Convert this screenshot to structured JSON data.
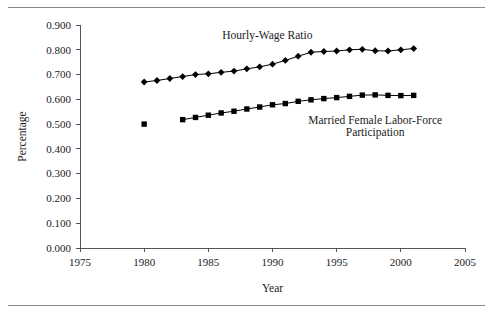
{
  "figure": {
    "has_top_rule": true,
    "has_bottom_rule": true,
    "background_color": "#ffffff",
    "ink_color": "#000000"
  },
  "chart_data": {
    "type": "line",
    "title": "",
    "xlabel": "Year",
    "ylabel": "Percentage",
    "xlim": [
      1975,
      2005
    ],
    "ylim": [
      0.0,
      0.9
    ],
    "xticks": [
      1975,
      1980,
      1985,
      1990,
      1995,
      2000,
      2005
    ],
    "xtick_labels": [
      "1975",
      "1980",
      "1985",
      "1990",
      "1995",
      "2000",
      "2005"
    ],
    "yticks": [
      0.0,
      0.1,
      0.2,
      0.3,
      0.4,
      0.5,
      0.6,
      0.7,
      0.8,
      0.9
    ],
    "ytick_labels": [
      "0.000",
      "0.100",
      "0.200",
      "0.300",
      "0.400",
      "0.500",
      "0.600",
      "0.700",
      "0.800",
      "0.900"
    ],
    "grid": false,
    "legend_position": "inline-annotations",
    "series": [
      {
        "name": "Hourly-Wage Ratio",
        "marker": "diamond",
        "connected": true,
        "x": [
          1980,
          1981,
          1982,
          1983,
          1984,
          1985,
          1986,
          1987,
          1988,
          1989,
          1990,
          1991,
          1992,
          1993,
          1994,
          1995,
          1996,
          1997,
          1998,
          1999,
          2000,
          2001
        ],
        "values": [
          0.67,
          0.676,
          0.684,
          0.692,
          0.7,
          0.703,
          0.709,
          0.714,
          0.723,
          0.731,
          0.742,
          0.757,
          0.774,
          0.79,
          0.793,
          0.795,
          0.8,
          0.802,
          0.796,
          0.795,
          0.8,
          0.805
        ]
      },
      {
        "name": "Married Female Labor-Force Participation",
        "marker": "square",
        "connected": true,
        "x": [
          1983,
          1984,
          1985,
          1986,
          1987,
          1988,
          1989,
          1990,
          1991,
          1992,
          1993,
          1994,
          1995,
          1996,
          1997,
          1998,
          1999,
          2000,
          2001
        ],
        "values": [
          0.518,
          0.527,
          0.536,
          0.545,
          0.552,
          0.561,
          0.569,
          0.578,
          0.583,
          0.592,
          0.598,
          0.603,
          0.607,
          0.612,
          0.617,
          0.618,
          0.616,
          0.615,
          0.616
        ]
      },
      {
        "name": "Married Female Labor-Force Participation (isolated 1980 point)",
        "marker": "square",
        "connected": false,
        "x": [
          1980
        ],
        "values": [
          0.5
        ]
      }
    ],
    "annotations": [
      {
        "text": "Hourly-Wage Ratio",
        "x": 1989.6,
        "y": 0.845
      },
      {
        "text": "Married Female Labor-Force",
        "x": 1998.0,
        "y": 0.5
      },
      {
        "text": "Participation",
        "x": 1998.0,
        "y": 0.452
      }
    ]
  }
}
